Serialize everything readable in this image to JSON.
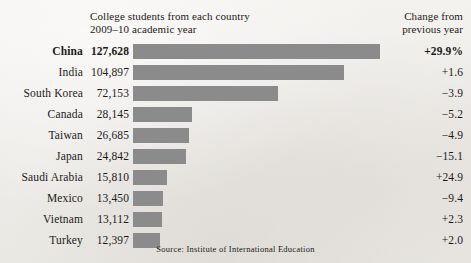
{
  "header": {
    "main_title": "College students from each country\n2009–10 academic year",
    "change_title": "Change from\nprevious year"
  },
  "source": {
    "text": "Source: Institute of International Education"
  },
  "style": {
    "bar_color": "#8b8b8b",
    "background_color": "#f1efec",
    "text_color": "#1b1a18"
  },
  "chart_data": {
    "type": "bar",
    "orientation": "horizontal",
    "title": "College students from each country",
    "subtitle": "2009–10 academic year",
    "xlabel": "",
    "ylabel": "",
    "source": "Source: Institute of International Education",
    "grid": false,
    "legend": "none",
    "xlim": [
      0,
      127628
    ],
    "categories": [
      "China",
      "India",
      "South Korea",
      "Canada",
      "Taiwan",
      "Japan",
      "Saudi Arabia",
      "Mexico",
      "Vietnam",
      "Turkey"
    ],
    "values": [
      127628,
      104897,
      72153,
      28145,
      26685,
      24842,
      15810,
      13450,
      13112,
      12397
    ],
    "value_labels": [
      "127,628",
      "104,897",
      "72,153",
      "28,145",
      "26,685",
      "24,842",
      "15,810",
      "13,450",
      "13,112",
      "12,397"
    ],
    "annotations": {
      "column_name": "Change from previous year",
      "values": [
        29.9,
        1.6,
        -3.9,
        -5.2,
        -4.9,
        -15.1,
        24.9,
        -9.4,
        2.3,
        2.0
      ],
      "labels": [
        "+29.9%",
        "+1.6",
        "-3.9",
        "-5.2",
        "-4.9",
        "-15.1",
        "+24.9",
        "-9.4",
        "+2.3",
        "+2.0"
      ]
    },
    "highlighted_category": "China"
  },
  "rows": [
    {
      "country": "China",
      "value": "127,628",
      "change": "+29.9%",
      "bar_px": 247,
      "highlight": true
    },
    {
      "country": "India",
      "value": "104,897",
      "change": "+1.6",
      "bar_px": 211,
      "highlight": false
    },
    {
      "country": "South Korea",
      "value": "72,153",
      "change": "−3.9",
      "bar_px": 145,
      "highlight": false
    },
    {
      "country": "Canada",
      "value": "28,145",
      "change": "−5.2",
      "bar_px": 59,
      "highlight": false
    },
    {
      "country": "Taiwan",
      "value": "26,685",
      "change": "−4.9",
      "bar_px": 56,
      "highlight": false
    },
    {
      "country": "Japan",
      "value": "24,842",
      "change": "−15.1",
      "bar_px": 53,
      "highlight": false
    },
    {
      "country": "Saudi Arabia",
      "value": "15,810",
      "change": "+24.9",
      "bar_px": 34,
      "highlight": false
    },
    {
      "country": "Mexico",
      "value": "13,450",
      "change": "−9.4",
      "bar_px": 30,
      "highlight": false
    },
    {
      "country": "Vietnam",
      "value": "13,112",
      "change": "+2.3",
      "bar_px": 29,
      "highlight": false
    },
    {
      "country": "Turkey",
      "value": "12,397",
      "change": "+2.0",
      "bar_px": 27,
      "highlight": false
    }
  ]
}
